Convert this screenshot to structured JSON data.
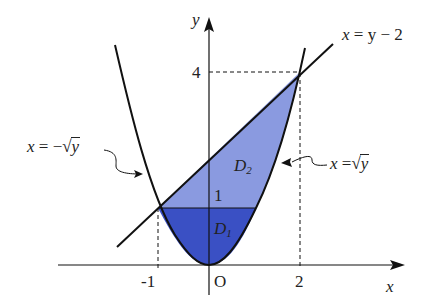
{
  "figure": {
    "axes": {
      "x_label": "x",
      "y_label": "y",
      "origin_label": "O",
      "x_ticks": [
        "-1",
        "2"
      ],
      "y_ticks": [
        "1",
        "4"
      ]
    },
    "curves": {
      "line": {
        "label_lhs": "x",
        "label_rhs": "= y − 2"
      },
      "left_branch": {
        "label_lhs": "x",
        "label_eq": "= −",
        "label_rad": "√",
        "label_arg": "y"
      },
      "right_branch": {
        "label_lhs": "x",
        "label_eq": "=",
        "label_rad": "√",
        "label_arg": "y"
      }
    },
    "regions": {
      "D1": {
        "name": "D",
        "sub": "1",
        "color": "#3a50c4"
      },
      "D2": {
        "name": "D",
        "sub": "2",
        "color": "#8a9ae0"
      }
    },
    "colors": {
      "stroke": "#111111",
      "D1_fill": "#3a50c4",
      "D2_fill": "#8a9ae0"
    }
  }
}
